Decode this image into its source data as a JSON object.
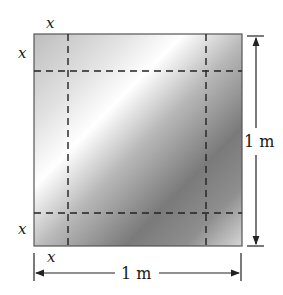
{
  "diagram": {
    "sheet": {
      "label": "square sheet with corner cutouts",
      "side_label": "1 m",
      "corner_label": "x"
    },
    "labels": {
      "top_x": "x",
      "left_top_x": "x",
      "left_bottom_x": "x",
      "bottom_x": "x",
      "right_dimension": "1 m",
      "bottom_dimension": "1 m"
    },
    "colors": {
      "border": "#555555",
      "dash": "#222222",
      "light": "#f4f4f4",
      "dark": "#6e6e6e"
    }
  }
}
